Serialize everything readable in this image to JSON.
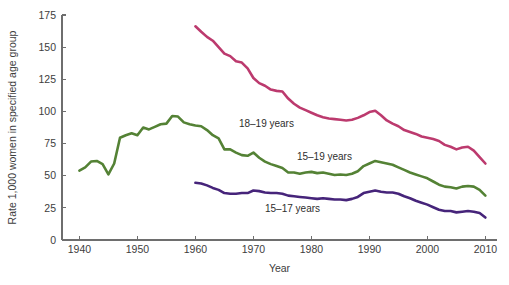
{
  "chart_data": {
    "type": "line",
    "title": "",
    "xlabel": "Year",
    "ylabel": "Rate 1,000 women in specified age group",
    "xlim": [
      1937,
      2012
    ],
    "ylim": [
      0,
      175
    ],
    "grid": false,
    "legend_position": "inline-annotations",
    "x_ticks": [
      1940,
      1950,
      1960,
      1970,
      1980,
      1990,
      2000,
      2010
    ],
    "y_ticks": [
      0,
      25,
      50,
      75,
      100,
      125,
      150,
      175
    ],
    "series": [
      {
        "name": "18-19 years",
        "label": "18–19 years",
        "color": "#bc3a6e",
        "label_x": 1967.5,
        "label_y": 88,
        "x": [
          1960,
          1961,
          1962,
          1963,
          1964,
          1965,
          1966,
          1967,
          1968,
          1969,
          1970,
          1971,
          1972,
          1973,
          1974,
          1975,
          1976,
          1977,
          1978,
          1979,
          1980,
          1981,
          1982,
          1983,
          1984,
          1985,
          1986,
          1987,
          1988,
          1989,
          1990,
          1991,
          1992,
          1993,
          1994,
          1995,
          1996,
          1997,
          1998,
          1999,
          2000,
          2001,
          2002,
          2003,
          2004,
          2005,
          2006,
          2007,
          2008,
          2009,
          2010
        ],
        "y": [
          166.2,
          162.0,
          158.0,
          155.0,
          150.0,
          145.0,
          143.0,
          139.0,
          138.0,
          133.5,
          126.0,
          122.0,
          120.0,
          117.0,
          116.0,
          115.5,
          110.0,
          106.0,
          103.0,
          101.0,
          99.0,
          97.0,
          95.5,
          94.5,
          94.0,
          93.5,
          93.0,
          93.5,
          95.0,
          97.0,
          99.5,
          100.5,
          97.0,
          93.0,
          90.5,
          88.5,
          85.5,
          84.0,
          82.5,
          80.5,
          79.5,
          78.5,
          77.0,
          74.0,
          72.5,
          70.5,
          72.0,
          72.5,
          69.5,
          64.5,
          59.5
        ]
      },
      {
        "name": "15-19 years",
        "label": "15–19 years",
        "color": "#548235",
        "label_x": 1977.5,
        "label_y": 62,
        "x": [
          1940,
          1941,
          1942,
          1943,
          1944,
          1945,
          1946,
          1947,
          1948,
          1949,
          1950,
          1951,
          1952,
          1953,
          1954,
          1955,
          1956,
          1957,
          1958,
          1959,
          1960,
          1961,
          1962,
          1963,
          1964,
          1965,
          1966,
          1967,
          1968,
          1969,
          1970,
          1971,
          1972,
          1973,
          1974,
          1975,
          1976,
          1977,
          1978,
          1979,
          1980,
          1981,
          1982,
          1983,
          1984,
          1985,
          1986,
          1987,
          1988,
          1989,
          1990,
          1991,
          1992,
          1993,
          1994,
          1995,
          1996,
          1997,
          1998,
          1999,
          2000,
          2001,
          2002,
          2003,
          2004,
          2005,
          2006,
          2007,
          2008,
          2009,
          2010
        ],
        "y": [
          54.0,
          56.5,
          61.0,
          61.5,
          59.0,
          51.0,
          59.5,
          79.5,
          81.5,
          83.0,
          81.5,
          87.5,
          86.0,
          88.0,
          90.0,
          90.5,
          96.5,
          96.0,
          91.5,
          90.0,
          89.0,
          88.5,
          85.5,
          81.5,
          79.0,
          70.5,
          70.5,
          68.0,
          66.0,
          65.5,
          68.0,
          64.0,
          61.0,
          59.0,
          57.5,
          56.0,
          52.5,
          52.5,
          51.5,
          52.5,
          53.0,
          52.0,
          52.5,
          51.5,
          50.5,
          51.0,
          50.5,
          51.5,
          53.5,
          57.5,
          59.5,
          61.5,
          60.5,
          59.5,
          58.5,
          56.5,
          54.5,
          52.5,
          51.0,
          49.5,
          48.0,
          45.5,
          43.0,
          41.5,
          41.0,
          40.0,
          41.5,
          42.0,
          41.5,
          39.0,
          34.5
        ]
      },
      {
        "name": "15-17 years",
        "label": "15–17 years",
        "color": "#46247a",
        "label_x": 1972.0,
        "label_y": 22,
        "x": [
          1960,
          1961,
          1962,
          1963,
          1964,
          1965,
          1966,
          1967,
          1968,
          1969,
          1970,
          1971,
          1972,
          1973,
          1974,
          1975,
          1976,
          1977,
          1978,
          1979,
          1980,
          1981,
          1982,
          1983,
          1984,
          1985,
          1986,
          1987,
          1988,
          1989,
          1990,
          1991,
          1992,
          1993,
          1994,
          1995,
          1996,
          1997,
          1998,
          1999,
          2000,
          2001,
          2002,
          2003,
          2004,
          2005,
          2006,
          2007,
          2008,
          2009,
          2010
        ],
        "y": [
          44.5,
          44.0,
          42.5,
          40.5,
          39.0,
          36.5,
          36.0,
          36.0,
          36.5,
          36.5,
          38.5,
          38.0,
          37.0,
          36.5,
          36.5,
          36.0,
          34.5,
          34.0,
          33.5,
          33.0,
          32.5,
          32.0,
          32.5,
          32.0,
          31.5,
          31.5,
          31.0,
          32.0,
          33.5,
          36.5,
          37.5,
          38.5,
          37.5,
          37.0,
          37.0,
          36.0,
          34.0,
          32.5,
          30.5,
          29.0,
          27.5,
          25.5,
          23.5,
          22.5,
          22.5,
          21.5,
          22.0,
          22.5,
          22.0,
          21.0,
          17.5
        ]
      }
    ]
  },
  "axes": {
    "y_axis_title": "Rate 1,000 women in specified age group",
    "x_axis_title": "Year",
    "x_tick_labels": [
      "1940",
      "1950",
      "1960",
      "1970",
      "1980",
      "1990",
      "2000",
      "2010"
    ],
    "y_tick_labels": [
      "0",
      "25",
      "50",
      "75",
      "100",
      "125",
      "150",
      "175"
    ]
  }
}
